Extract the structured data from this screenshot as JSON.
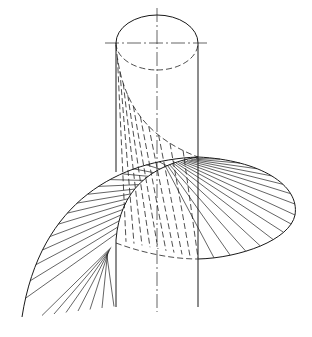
{
  "figure": {
    "line_color": "#1a1a1a",
    "background": "#ffffff",
    "cylinder": {
      "left_x": 116,
      "right_x": 198,
      "center_x": 157,
      "top_y": 43,
      "top_ellipse_ry": 28,
      "bottom_y": 307
    },
    "rulings_count_left": 18,
    "rulings_count_right": 16,
    "rulings_count_hidden": 10
  }
}
